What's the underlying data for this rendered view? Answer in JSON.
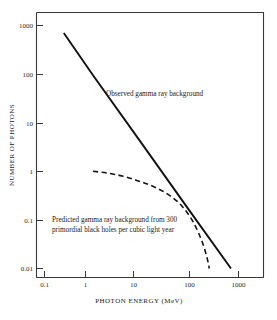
{
  "chart_data": {
    "type": "line",
    "title": "",
    "xlabel": "PHOTON ENERGY (MeV)",
    "ylabel": "NUMBER OF PHOTONS",
    "xscale": "log",
    "yscale": "log",
    "xlim": [
      0.065,
      2300
    ],
    "ylim": [
      0.0062,
      2300
    ],
    "xticks": [
      "0.1",
      "1",
      "10",
      "100",
      "1000"
    ],
    "xtick_values": [
      0.1,
      1,
      10,
      100,
      1000
    ],
    "yticks": [
      "1000",
      "100",
      "10",
      "1",
      "0.1",
      "0.01"
    ],
    "ytick_values": [
      1000,
      100,
      10,
      1,
      0.1,
      0.01
    ],
    "grid": false,
    "legend_position": "inline-annotations",
    "series": [
      {
        "name": "Observed gamma ray background",
        "style": "solid",
        "color": "#111111",
        "x": [
          0.25,
          1,
          10,
          100,
          700
        ],
        "y": [
          700,
          95,
          3.8,
          0.15,
          0.01
        ]
      },
      {
        "name": "Predicted gamma ray background from 300 primordial black holes per cubic light year",
        "style": "dashed",
        "color": "#151515",
        "x": [
          1,
          2,
          4,
          8,
          15,
          30,
          60,
          110,
          170,
          220,
          250
        ],
        "y": [
          1.0,
          0.92,
          0.8,
          0.65,
          0.52,
          0.37,
          0.22,
          0.1,
          0.04,
          0.018,
          0.01
        ]
      }
    ],
    "annotations": [
      {
        "id": "observed-label",
        "text": "Observed gamma ray background",
        "lines": [
          "Observed gamma ray background"
        ],
        "x_px": 106,
        "y_px": 96
      },
      {
        "id": "predicted-label",
        "text": "Predicted gamma ray background from 300 primordial black holes per cubic light year",
        "lines": [
          "Predicted gamma ray background from  300",
          "primordial black holes per cubic light year"
        ],
        "x_px": 52,
        "y_px": 222
      }
    ]
  },
  "axes": {
    "x_title": "PHOTON ENERGY (MeV)",
    "y_title": "NUMBER OF PHOTONS",
    "x_tick_labels": [
      "0.1",
      "1",
      "10",
      "100",
      "1000"
    ],
    "y_tick_labels": [
      "1000",
      "100",
      "10",
      "1",
      "0.1",
      "0.01"
    ]
  },
  "colors": {
    "background": "#ffffff",
    "frame": "#3a3a3a",
    "observed_line": "#111111",
    "predicted_line": "#151515",
    "text": "#1a1a1a"
  }
}
